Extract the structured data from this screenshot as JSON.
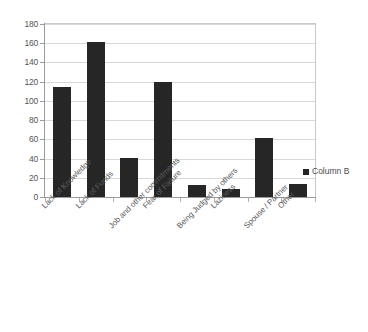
{
  "chart_data": {
    "type": "bar",
    "title": "",
    "subtitle": "",
    "xlabel": "",
    "ylabel": "",
    "ylim": [
      0,
      180
    ],
    "ytick_step": 20,
    "yticks": [
      0,
      20,
      40,
      60,
      80,
      100,
      120,
      140,
      160,
      180
    ],
    "ytick_labels": [
      "0",
      "20",
      "40",
      "60",
      "80",
      "100",
      "120",
      "140",
      "160",
      "180"
    ],
    "grid": "horizontal",
    "legend_position": "right",
    "categories": [
      "Lack of Knowledge",
      "Lack of Funds",
      "Job and other commitments",
      "Fear of Failure",
      "Being Judged by others",
      "Laziness",
      "Spouse / Partner",
      "Other"
    ],
    "series": [
      {
        "name": "Column B",
        "color": "#262626",
        "values": [
          114,
          161,
          41,
          120,
          12,
          8,
          61,
          14
        ]
      }
    ]
  },
  "legend": {
    "entries": [
      {
        "label": "Column B",
        "color": "#262626",
        "marker": "square-marker"
      }
    ]
  },
  "colors": {
    "bar": "#262626",
    "gridline": "#d8d8d8",
    "axis": "#9a9a9a",
    "frame": "#c9c9c9",
    "text": "#555555",
    "background": "#ffffff"
  }
}
